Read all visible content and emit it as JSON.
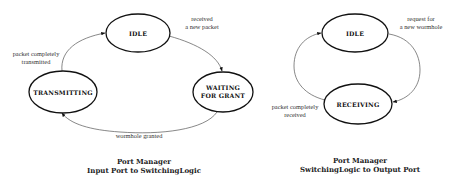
{
  "diagrams": [
    {
      "caption": {
        "line1": "Port Manager",
        "line2": "Input Port to SwitchingLogic"
      },
      "states": [
        {
          "id": "idle",
          "label": "IDLE"
        },
        {
          "id": "waiting",
          "label_line1": "WAITING",
          "label_line2": "FOR GRANT"
        },
        {
          "id": "transmitting",
          "label": "TRANSMITTING"
        }
      ],
      "transitions": [
        {
          "from": "idle",
          "to": "waiting",
          "label_line1": "received",
          "label_line2": "a new packet"
        },
        {
          "from": "waiting",
          "to": "transmitting",
          "label": "wormhole granted"
        },
        {
          "from": "transmitting",
          "to": "idle",
          "label_line1": "packet completely",
          "label_line2": "transmitted"
        }
      ]
    },
    {
      "caption": {
        "line1": "Port Manager",
        "line2": "SwitchingLogic to Output Port"
      },
      "states": [
        {
          "id": "idle",
          "label": "IDLE"
        },
        {
          "id": "receiving",
          "label": "RECEIVING"
        }
      ],
      "transitions": [
        {
          "from": "idle",
          "to": "receiving",
          "label_line1": "request for",
          "label_line2": "a new wormhole"
        },
        {
          "from": "receiving",
          "to": "idle",
          "label_line1": "packet completely",
          "label_line2": "received"
        }
      ]
    }
  ],
  "colors": {
    "state_stroke": "#111111",
    "edge_stroke": "#555555",
    "background": "#ffffff"
  }
}
